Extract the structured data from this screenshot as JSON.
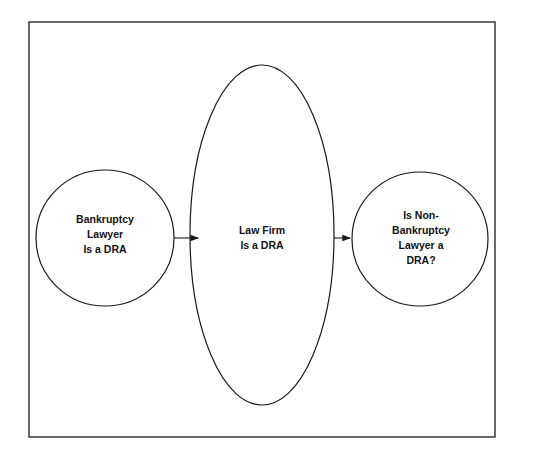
{
  "diagram": {
    "nodes": [
      {
        "id": "left",
        "shape": "circle",
        "lines": [
          "Bankruptcy",
          "Lawyer",
          "Is a DRA"
        ]
      },
      {
        "id": "middle",
        "shape": "ellipse",
        "lines": [
          "Law Firm",
          "Is a DRA"
        ]
      },
      {
        "id": "right",
        "shape": "circle",
        "lines": [
          "Is Non-",
          "Bankruptcy",
          "Lawyer a",
          "DRA?"
        ]
      }
    ],
    "edges": [
      {
        "from": "left",
        "to": "middle"
      },
      {
        "from": "middle",
        "to": "right"
      }
    ],
    "colors": {
      "stroke": "#1a1a1a",
      "background": "#ffffff"
    }
  }
}
